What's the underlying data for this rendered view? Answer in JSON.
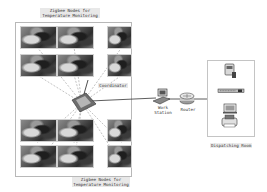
{
  "diagram": {
    "title_top": "Zigbee Nodes for Temperature Monitoring",
    "title_top_lines": [
      "Zigbee Nodes for",
      "Temperature Monitoring"
    ],
    "title_bottom_lines": [
      "Zigbee Nodes for",
      "Temperature Monitoring"
    ],
    "coordinator_label": "Coordinator",
    "workstation_label_lines": [
      "Work",
      "Station"
    ],
    "router_label": "Router",
    "dispatching_room_label": "Dispatching Room",
    "node_count": 12,
    "nodes": [
      {
        "id": "node-1",
        "group": "top"
      },
      {
        "id": "node-2",
        "group": "top"
      },
      {
        "id": "node-3",
        "group": "top"
      },
      {
        "id": "node-4",
        "group": "top"
      },
      {
        "id": "node-5",
        "group": "top"
      },
      {
        "id": "node-6",
        "group": "top"
      },
      {
        "id": "node-7",
        "group": "bottom"
      },
      {
        "id": "node-8",
        "group": "bottom"
      },
      {
        "id": "node-9",
        "group": "bottom"
      },
      {
        "id": "node-10",
        "group": "bottom"
      },
      {
        "id": "node-11",
        "group": "bottom"
      },
      {
        "id": "node-12",
        "group": "bottom"
      }
    ],
    "dispatching_room_devices": [
      "server",
      "rack-unit",
      "monitor",
      "printer"
    ],
    "colors": {
      "line": "#333333",
      "dashed_link": "#999999",
      "label_bg": "#e8e8e8",
      "box_border": "#b8b8b8"
    }
  }
}
